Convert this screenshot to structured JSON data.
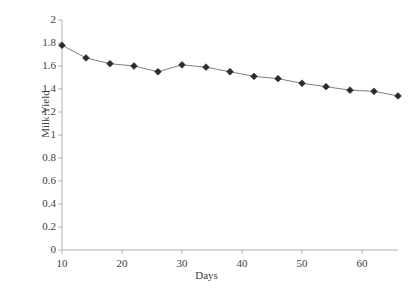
{
  "chart_data": {
    "type": "line",
    "title": "",
    "xlabel": "Days",
    "ylabel": "Milk Yield",
    "xlim": [
      8,
      68
    ],
    "ylim": [
      0,
      2
    ],
    "grid": false,
    "legend": null,
    "marker": "diamond",
    "marker_color": "#2b2b2b",
    "line_color": "#808080",
    "axis_color": "#b3b3b3",
    "xticks": [
      10,
      20,
      30,
      40,
      50,
      60
    ],
    "xtick_labels": [
      "10",
      "20",
      "30",
      "40",
      "50",
      "60"
    ],
    "yticks": [
      0,
      0.2,
      0.4,
      0.6,
      0.8,
      1,
      1.2,
      1.4,
      1.6,
      1.8,
      2
    ],
    "ytick_labels": [
      "0",
      "0.2",
      "0.4",
      "0.6",
      "0.8",
      "1",
      "1.2",
      "1.4",
      "1.6",
      "1.8",
      "2"
    ],
    "x": [
      10,
      14,
      18,
      22,
      26,
      30,
      34,
      38,
      42,
      46,
      50,
      54,
      58,
      62,
      66
    ],
    "values": [
      1.78,
      1.67,
      1.62,
      1.6,
      1.55,
      1.61,
      1.59,
      1.55,
      1.51,
      1.49,
      1.45,
      1.42,
      1.39,
      1.38,
      1.34
    ],
    "series": [
      {
        "name": "Milk Yield",
        "values": [
          1.78,
          1.67,
          1.62,
          1.6,
          1.55,
          1.61,
          1.59,
          1.55,
          1.51,
          1.49,
          1.45,
          1.42,
          1.39,
          1.38,
          1.34
        ]
      }
    ]
  },
  "axes": {
    "y_title": "Milk Yield",
    "x_title": "Days"
  }
}
